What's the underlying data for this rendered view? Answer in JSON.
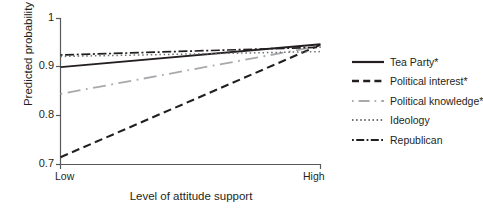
{
  "chart_data": {
    "type": "line",
    "title": "",
    "xlabel": "Level of attitude support",
    "ylabel": "Predicted probability",
    "x": [
      0,
      1
    ],
    "xtick_labels": [
      "Low",
      "High"
    ],
    "ytick_labels": [
      "0.7",
      "0.8",
      "0.9",
      "1"
    ],
    "ytick_values": [
      0.7,
      0.8,
      0.9,
      1.0
    ],
    "ylim": [
      0.7,
      1.0
    ],
    "xlim": [
      0,
      1
    ],
    "grid": false,
    "legend_position": "right",
    "series": [
      {
        "name": "Tea Party*",
        "style": "solid",
        "color": "#231f20",
        "width": 1.9,
        "values": [
          0.9,
          0.947
        ]
      },
      {
        "name": "Political interest*",
        "style": "dashed",
        "color": "#231f20",
        "width": 2.1,
        "values": [
          0.715,
          0.946
        ]
      },
      {
        "name": "Political knowledge*",
        "style": "dash-dot",
        "color": "#a7a9ac",
        "width": 1.8,
        "values": [
          0.845,
          0.944
        ]
      },
      {
        "name": "Ideology",
        "style": "dotted",
        "color": "#6d6e71",
        "width": 1.5,
        "values": [
          0.922,
          0.932
        ]
      },
      {
        "name": "Republican",
        "style": "dash-dot-dense",
        "color": "#231f20",
        "width": 1.7,
        "values": [
          0.925,
          0.941
        ]
      }
    ]
  },
  "axes": {
    "ylabel": "Predicted probability",
    "xlabel": "Level of attitude support",
    "ytick_labels": [
      "1",
      "0.9",
      "0.8",
      "0.7"
    ],
    "xtick_labels": [
      "Low",
      "High"
    ]
  },
  "legend": {
    "items": [
      {
        "label": "Tea Party*",
        "sample": "solid-line-swatch"
      },
      {
        "label": "Political interest*",
        "sample": "dashed-line-swatch"
      },
      {
        "label": "Political knowledge*",
        "sample": "gray-dash-dot-line-swatch"
      },
      {
        "label": "Ideology",
        "sample": "dotted-line-swatch"
      },
      {
        "label": "Republican",
        "sample": "dash-dot-line-swatch"
      }
    ]
  }
}
